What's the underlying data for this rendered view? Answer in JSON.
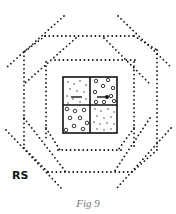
{
  "figure": {
    "label": "RS",
    "caption": "Fig 9"
  },
  "diagram": {
    "center_grid": {
      "cells": [
        {
          "position": "top-left",
          "texture": "fine-dots",
          "mark": "dash"
        },
        {
          "position": "top-right",
          "texture": "small-circles",
          "mark": "arrow-dot"
        },
        {
          "position": "bottom-left",
          "texture": "small-circles",
          "mark": ""
        },
        {
          "position": "bottom-right",
          "texture": "fine-dots",
          "mark": ""
        }
      ]
    },
    "dotted_layers": [
      "inner-square",
      "inner-diamond",
      "outer-square",
      "outer-diamond"
    ],
    "colors": {
      "ink": "#111111",
      "caption": "#777777",
      "background": "#ffffff"
    }
  }
}
